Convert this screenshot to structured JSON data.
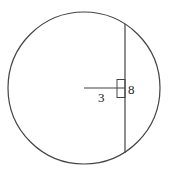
{
  "diagram": {
    "labels": {
      "distance": "3",
      "half_chord": "8"
    },
    "colors": {
      "stroke": "#333333",
      "background": "#ffffff"
    }
  }
}
